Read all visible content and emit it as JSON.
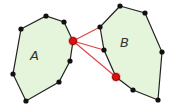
{
  "diagram": {
    "colors": {
      "fill": "#e4f5dc",
      "edge": "#222222",
      "vertex": "#111111",
      "highlight": "#e01010",
      "link": "#e04040"
    },
    "polygons": [
      {
        "label": "A",
        "label_pos": [
          35,
          56
        ],
        "vertices": [
          [
            21,
            29
          ],
          [
            46,
            16
          ],
          [
            64,
            22
          ],
          [
            73,
            41
          ],
          [
            70,
            61
          ],
          [
            59,
            82
          ],
          [
            26,
            101
          ],
          [
            13,
            74
          ]
        ]
      },
      {
        "label": "B",
        "label_pos": [
          125,
          43
        ],
        "vertices": [
          [
            120,
            6
          ],
          [
            145,
            13
          ],
          [
            162,
            52
          ],
          [
            158,
            100
          ],
          [
            133,
            90
          ],
          [
            116,
            77
          ],
          [
            104,
            50
          ],
          [
            100,
            27
          ]
        ]
      }
    ],
    "highlighted_vertices": [
      [
        73,
        41
      ],
      [
        116,
        77
      ]
    ],
    "connecting_lines": [
      {
        "from": [
          73,
          41
        ],
        "to": [
          100,
          27
        ]
      },
      {
        "from": [
          73,
          41
        ],
        "to": [
          104,
          50
        ]
      },
      {
        "from": [
          73,
          41
        ],
        "to": [
          116,
          77
        ]
      }
    ]
  }
}
